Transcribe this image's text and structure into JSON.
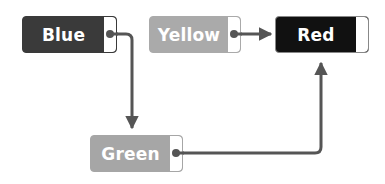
{
  "nodes": [
    {
      "id": "blue",
      "label": "Blue",
      "color": "#3a3a3a",
      "port_border": "#3a3a3a"
    },
    {
      "id": "yellow",
      "label": "Yellow",
      "color": "#aaaaaa",
      "port_border": "#aaaaaa"
    },
    {
      "id": "red",
      "label": "Red",
      "color": "#111111",
      "port_border": "#111111"
    },
    {
      "id": "green",
      "label": "Green",
      "color": "#a6a6a6",
      "port_border": "#a6a6a6"
    }
  ],
  "edges": [
    {
      "from": "Blue",
      "to": "Green"
    },
    {
      "from": "Yellow",
      "to": "Red"
    },
    {
      "from": "Green",
      "to": "Red"
    }
  ],
  "wire_color": "#555555"
}
